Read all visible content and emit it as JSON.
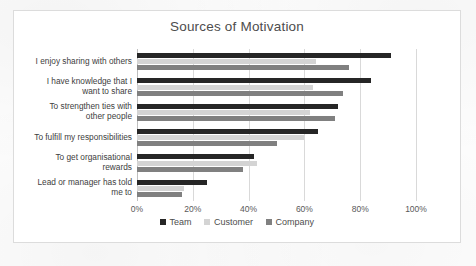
{
  "chart_data": {
    "type": "bar",
    "orientation": "horizontal",
    "title": "Sources of Motivation",
    "xlabel": "",
    "ylabel": "",
    "xlim": [
      0,
      100
    ],
    "xticks": [
      "0%",
      "20%",
      "40%",
      "60%",
      "80%",
      "100%"
    ],
    "xtick_values": [
      0,
      20,
      40,
      60,
      80,
      100
    ],
    "grid": true,
    "legend_position": "bottom",
    "categories": [
      "I enjoy sharing with others",
      "I have knowledge that I\nwant to share",
      "To strengthen ties with\nother people",
      "To fulfill my responsibilities",
      "To get organisational\nrewards",
      "Lead or manager has told\nme to"
    ],
    "series": [
      {
        "name": "Team",
        "color": "#262626",
        "values": [
          91,
          84,
          72,
          65,
          42,
          25
        ]
      },
      {
        "name": "Customer",
        "color": "#d4d4d4",
        "values": [
          64,
          63,
          62,
          60,
          43,
          17
        ]
      },
      {
        "name": "Company",
        "color": "#808080",
        "values": [
          76,
          74,
          71,
          50,
          38,
          16
        ]
      }
    ]
  }
}
